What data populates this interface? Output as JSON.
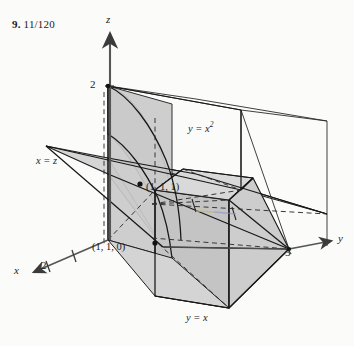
{
  "figure": {
    "answer_number": "9.",
    "answer_value": "11/120",
    "axes": {
      "z_label": "z",
      "y_label": "y",
      "x_label": "x"
    },
    "ticks": {
      "z_two": "2",
      "y_three": "3",
      "x_two": "2"
    },
    "surface_labels": {
      "parabolic_cylinder": "y = x",
      "parabolic_cylinder_exp": "2",
      "plane_xz": "x = z",
      "plane_yx": "y = x"
    },
    "points": {
      "upper": "(1, 1, 1)",
      "lower": "(1, 1, 0)"
    },
    "colors": {
      "ink": "#1d1d1d",
      "shade_light": "#d8d8d8",
      "shade_mid": "#c9c9c9",
      "shade_dark": "#b9b9b9",
      "axis": "#585858",
      "dash": "#3a3a3a",
      "paper": "#fbfbfa"
    }
  }
}
